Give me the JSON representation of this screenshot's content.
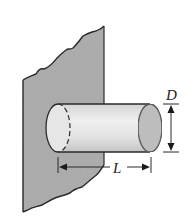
{
  "diagram": {
    "type": "pin-fin-on-wall",
    "elements": {
      "wall": {
        "description": "Wall with rough broken edges (base surface)",
        "fill": "#a9a9a9"
      },
      "rod": {
        "description": "Cylindrical rod protruding from wall",
        "fill": "#dcdcdc"
      },
      "diameter": {
        "label": "D",
        "description": "Rod diameter dimension"
      },
      "length": {
        "label": "L",
        "description": "Rod length dimension measured from wall"
      }
    },
    "colors": {
      "outline": "#2a2a2a",
      "wall_fill": "#a9a9a9",
      "rod_fill_light": "#eeeeee",
      "rod_fill_dark": "#bdbdbd",
      "rod_end_fill": "#b8b8b8"
    }
  }
}
